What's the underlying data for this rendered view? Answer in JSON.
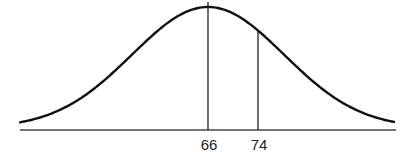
{
  "chart_data": {
    "type": "line",
    "title": "",
    "xlabel": "",
    "ylabel": "",
    "distribution": {
      "mean": 66,
      "sd_estimate": 12
    },
    "markers": [
      {
        "value": 66,
        "label": "66"
      },
      {
        "value": 74,
        "label": "74"
      }
    ],
    "x_ticks": [
      "66",
      "74"
    ],
    "grid": false,
    "legend": null
  },
  "colors": {
    "curve": "#111111",
    "axis": "#444444",
    "marker": "#222222"
  },
  "layout": {
    "baseline_y": 130,
    "x_start": 20,
    "x_end": 396,
    "peak_x": 208,
    "peak_y": 7,
    "tail_y": 128,
    "sigma_px": 76,
    "px_per_unit": 6.25
  }
}
